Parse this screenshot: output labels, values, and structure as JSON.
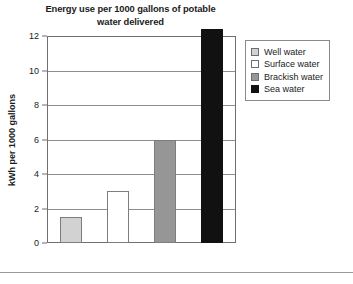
{
  "chart_data": {
    "type": "bar",
    "title": "Energy use per 1000 gallons of potable water delivered",
    "title_line1": "Energy use per 1000 gallons of potable",
    "title_line2": "water delivered",
    "xlabel": "",
    "ylabel": "kWh per 1000 gallons",
    "ylim": [
      0,
      12
    ],
    "ytick_labels": [
      "12",
      "10",
      "8",
      "6",
      "4",
      "2",
      "0"
    ],
    "ytick_values": [
      12,
      10,
      8,
      6,
      4,
      2,
      0
    ],
    "grid": true,
    "grid_axis": "y",
    "legend_position": "right",
    "categories": [
      "Well water",
      "Surface water",
      "Brackish water",
      "Sea water"
    ],
    "values": [
      1.5,
      3.0,
      6.0,
      12.4
    ],
    "value_notes": [
      "1.5",
      "3",
      "6",
      "exceeds axis maximum of 12"
    ],
    "series": [
      {
        "name": "Energy use",
        "values": [
          1.5,
          3.0,
          6.0,
          12.4
        ]
      }
    ],
    "bar_colors": [
      "#d2d2d2",
      "#ffffff",
      "#969696",
      "#111111"
    ],
    "bar_edge_color": "#7d7d7d"
  },
  "legend": {
    "items": [
      {
        "label": "Well water",
        "color": "#d2d2d2"
      },
      {
        "label": "Surface water",
        "color": "#ffffff"
      },
      {
        "label": "Brackish water",
        "color": "#969696"
      },
      {
        "label": "Sea water",
        "color": "#111111"
      }
    ]
  },
  "caption": {
    "text": ""
  },
  "colors": {
    "axis": "#6f6f6f",
    "grid": "#8d8d8d",
    "text": "#1b1b1b",
    "background": "#ffffff"
  }
}
